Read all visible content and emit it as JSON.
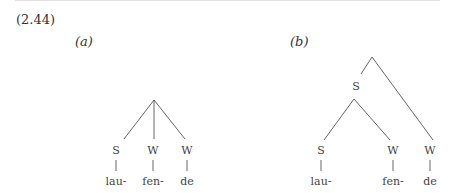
{
  "example_number": "(2.44)",
  "panels": [
    {
      "label": "(a)",
      "nodes": [
        "S",
        "W",
        "W"
      ],
      "syllables": [
        "lau-",
        "fen-",
        "de"
      ]
    },
    {
      "label": "(b)",
      "internal_node": "S",
      "nodes": [
        "S",
        "W",
        "W"
      ],
      "syllables": [
        "lau-",
        "fen-",
        "de"
      ]
    }
  ],
  "colors": {
    "line": "#555555",
    "text": "#444444"
  }
}
